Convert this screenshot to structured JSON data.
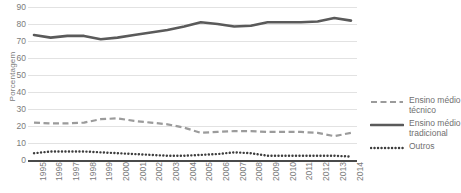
{
  "chart_data": {
    "type": "line",
    "title": "",
    "xlabel": "",
    "ylabel": "Porcentagem",
    "ylim": [
      0,
      90
    ],
    "ytick_step": 10,
    "yticks": [
      0,
      10,
      20,
      30,
      40,
      50,
      60,
      70,
      80,
      90
    ],
    "grid": true,
    "legend_position": "right",
    "categories": [
      "1995",
      "1996",
      "1997",
      "1998",
      "1999",
      "2000",
      "2001",
      "2002",
      "2003",
      "2004",
      "2005",
      "2006",
      "2007",
      "2008",
      "2009",
      "2010",
      "2011",
      "2012",
      "2013",
      "2014"
    ],
    "series": [
      {
        "name": "Ensino médio técnico",
        "style": "dashed",
        "color": "#9b9b9b",
        "values": [
          22,
          21.5,
          21.5,
          22,
          24,
          24.5,
          23,
          22,
          21,
          19,
          16,
          16.5,
          17,
          17,
          16.5,
          16.5,
          16.5,
          16,
          14,
          16
        ]
      },
      {
        "name": "Ensino médio tradicional",
        "style": "solid",
        "color": "#5a5a5a",
        "values": [
          73.5,
          72,
          73,
          73,
          71,
          72,
          73.5,
          75,
          76.5,
          78.5,
          81,
          80,
          78.5,
          79,
          81,
          81,
          81,
          81.5,
          83.5,
          82
        ]
      },
      {
        "name": "Outros",
        "style": "dotted",
        "color": "#3d3d3d",
        "values": [
          4,
          5,
          5,
          5,
          4.5,
          4,
          3.5,
          3,
          2.5,
          2.5,
          3,
          3.5,
          4.5,
          4,
          2.5,
          2.5,
          2.5,
          2.5,
          2.5,
          2
        ]
      }
    ],
    "legend_entries": [
      "Ensino médio\ntécnico",
      "Ensino médio\ntradicional",
      "Outros"
    ]
  },
  "colors": {
    "background": "#ffffff",
    "gridline": "#e2e2e2",
    "axis": "#4a4a4a",
    "tick_text": "#7b7b7b",
    "legend_text": "#6f6f6f"
  }
}
